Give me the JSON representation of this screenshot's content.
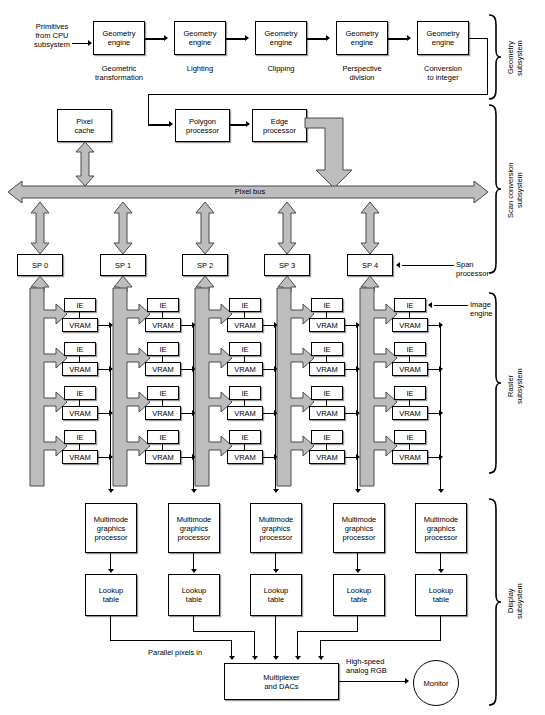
{
  "diagram": {
    "input_label": "Primitives\nfrom CPU\nsubsystem",
    "geometry_row": {
      "boxes": [
        "Geometry\nengine",
        "Geometry\nengine",
        "Geometry\nengine",
        "Geometry\nengine",
        "Geometry\nengine"
      ],
      "captions": [
        "Geometric\ntransformation",
        "Lighting",
        "Clipping",
        "Perspective\ndivision",
        "Conversion\nto integer"
      ]
    },
    "scan_conversion": {
      "pixel_cache": "Pixel\ncache",
      "polygon_processor": "Polygon\nprocessor",
      "edge_processor": "Edge\nprocessor",
      "pixel_bus": "Pixel bus",
      "span_processors": [
        "SP 0",
        "SP 1",
        "SP 2",
        "SP 3",
        "SP 4"
      ],
      "span_processor_label": "Span\nprocessor"
    },
    "raster": {
      "ie_label": "IE",
      "vram_label": "VRAM",
      "image_engine_label": "Image\nengine",
      "columns": 5,
      "pairs_per_column": 4
    },
    "display": {
      "graphics_processor": "Multimode\ngraphics\nprocessor",
      "lookup_table": "Lookup\ntable",
      "parallel_pixels_label": "Parallel pixels in",
      "multiplexer": "Multiplexer\nand DACs",
      "analog_rgb_label": "High-speed\nanalog RGB",
      "monitor": "Monitor"
    },
    "subsystems": [
      {
        "name": "Geometry\nsubsystem"
      },
      {
        "name": "Scan conversion\nsubsystem"
      },
      {
        "name": "Raster\nsubsystem"
      },
      {
        "name": "Display\nsubsystem"
      }
    ],
    "colors": {
      "line": "#000000",
      "box_fill": "#ffffff",
      "gray_arrow_fill": "#bdbdbd",
      "gray_arrow_stroke": "#4a4a4a",
      "shadow": "#9a9a9a"
    }
  }
}
